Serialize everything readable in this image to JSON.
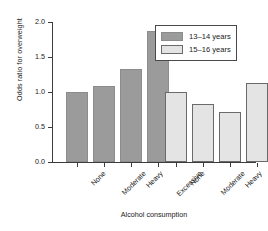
{
  "chart_data": {
    "type": "bar",
    "title": "",
    "xlabel": "Alcohol consumption",
    "ylabel": "Odds ratio for overweight",
    "categories": [
      "None",
      "Moderate",
      "Heavy",
      "Excessive"
    ],
    "series": [
      {
        "name": "13–14 years",
        "color": "#9b9b9b",
        "values": [
          1.0,
          1.08,
          1.33,
          1.87
        ]
      },
      {
        "name": "15–16 years",
        "color": "#e4e4e4",
        "values": [
          1.0,
          0.83,
          0.71,
          1.13
        ]
      }
    ],
    "ylim": [
      0.0,
      2.0
    ],
    "ytick_labels": [
      "0.0",
      "0.5",
      "1.0",
      "1.5",
      "2.0"
    ],
    "ytick_values": [
      0.0,
      0.5,
      1.0,
      1.5,
      2.0
    ],
    "xtick_labels": [
      "None",
      "Moderate",
      "Heavy",
      "Excessive",
      "None",
      "Moderate",
      "Heavy",
      "Excessive"
    ],
    "grid": false,
    "legend_position": "top-right"
  },
  "legend": {
    "entries": [
      {
        "label": "13–14 years"
      },
      {
        "label": "15–16 years"
      }
    ]
  }
}
